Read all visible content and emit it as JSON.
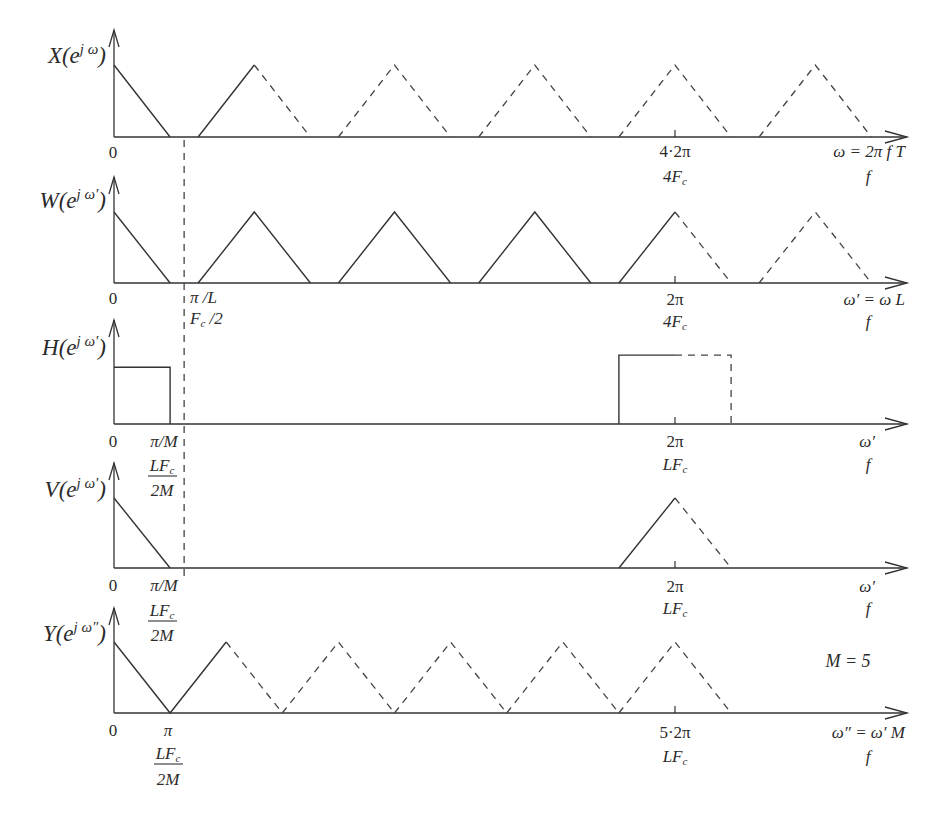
{
  "figure": {
    "note": "M = 5",
    "reference_line": {
      "panel": "w",
      "position_pi": 0.25,
      "meaning": "π/L",
      "style": "dashed"
    },
    "panels": {
      "x": {
        "ylabel": {
          "base": "X(e",
          "sup": "j ω",
          "close": ")"
        },
        "origin": "0",
        "tick": {
          "position_pi": 8,
          "line1": "4·2π",
          "line2_main": "4F",
          "line2_sub": "c"
        },
        "axis_label": {
          "line1": "ω = 2π f T",
          "line2": "f"
        },
        "components": [
          {
            "style": "solid",
            "points": [
              [
                0,
                1
              ],
              [
                0.8,
                0
              ]
            ]
          },
          {
            "style": "solid",
            "points": [
              [
                1.2,
                0
              ],
              [
                2,
                1
              ]
            ]
          },
          {
            "style": "dashed",
            "points": [
              [
                2,
                1
              ],
              [
                2.8,
                0
              ]
            ]
          },
          {
            "style": "dashed",
            "points": [
              [
                3.2,
                0
              ],
              [
                4,
                1
              ],
              [
                4.8,
                0
              ]
            ]
          },
          {
            "style": "dashed",
            "points": [
              [
                5.2,
                0
              ],
              [
                6,
                1
              ],
              [
                6.8,
                0
              ]
            ]
          },
          {
            "style": "dashed",
            "points": [
              [
                7.2,
                0
              ],
              [
                8,
                1
              ],
              [
                8.8,
                0
              ]
            ]
          },
          {
            "style": "dashed",
            "points": [
              [
                9.2,
                0
              ],
              [
                10,
                1
              ],
              [
                10.8,
                0
              ]
            ]
          }
        ]
      },
      "w": {
        "ylabel": {
          "base": "W(e",
          "sup": "j ω′",
          "close": ")"
        },
        "origin": "0",
        "cutoff": {
          "line1": "π /L",
          "line2_main": "F",
          "line2_sub": "c",
          "line2_rest": " /2"
        },
        "tick": {
          "position_pi": 2,
          "line1": "2π",
          "line2_main": "4F",
          "line2_sub": "c"
        },
        "axis_label": {
          "line1": "ω′ = ω  L",
          "line2": "f"
        },
        "components": [
          {
            "style": "solid",
            "points": [
              [
                0,
                1
              ],
              [
                0.2,
                0
              ]
            ]
          },
          {
            "style": "solid",
            "points": [
              [
                0.3,
                0
              ],
              [
                0.5,
                1
              ],
              [
                0.7,
                0
              ]
            ]
          },
          {
            "style": "solid",
            "points": [
              [
                0.8,
                0
              ],
              [
                1,
                1
              ],
              [
                1.2,
                0
              ]
            ]
          },
          {
            "style": "solid",
            "points": [
              [
                1.3,
                0
              ],
              [
                1.5,
                1
              ],
              [
                1.7,
                0
              ]
            ]
          },
          {
            "style": "solid",
            "points": [
              [
                1.8,
                0
              ],
              [
                2,
                1
              ]
            ]
          },
          {
            "style": "dashed",
            "points": [
              [
                2,
                1
              ],
              [
                2.2,
                0
              ]
            ]
          },
          {
            "style": "dashed",
            "points": [
              [
                2.3,
                0
              ],
              [
                2.5,
                1
              ],
              [
                2.7,
                0
              ]
            ]
          }
        ]
      },
      "h": {
        "ylabel": {
          "base": "H(e",
          "sup": "j ω′",
          "close": ")"
        },
        "origin": "0",
        "cutoff": {
          "line1": "π/M",
          "num_main": "LF",
          "num_sub": "c",
          "den": "2M"
        },
        "tick": {
          "position_pi": 2,
          "line1": "2π",
          "line2_main": "LF",
          "line2_sub": "c"
        },
        "axis_label": {
          "line1": "ω′",
          "line2": "f"
        },
        "components": [
          {
            "style": "solid",
            "points": [
              [
                0,
                0.8
              ],
              [
                0.2,
                0.8
              ],
              [
                0.2,
                0
              ]
            ]
          },
          {
            "style": "solid",
            "points": [
              [
                1.8,
                0
              ],
              [
                1.8,
                0.97
              ],
              [
                2,
                0.97
              ]
            ]
          },
          {
            "style": "dashed",
            "points": [
              [
                2,
                0.97
              ],
              [
                2.2,
                0.97
              ],
              [
                2.2,
                0
              ]
            ]
          }
        ]
      },
      "v": {
        "ylabel": {
          "base": "V(e",
          "sup": "j ω′",
          "close": ")"
        },
        "origin": "0",
        "cutoff": {
          "line1": "π/M",
          "num_main": "LF",
          "num_sub": "c",
          "den": "2M"
        },
        "tick": {
          "position_pi": 2,
          "line1": "2π",
          "line2_main": "LF",
          "line2_sub": "c"
        },
        "axis_label": {
          "line1": "ω′",
          "line2": "f"
        },
        "components": [
          {
            "style": "solid",
            "points": [
              [
                0,
                1
              ],
              [
                0.2,
                0
              ]
            ]
          },
          {
            "style": "solid",
            "points": [
              [
                1.8,
                0
              ],
              [
                2,
                1
              ]
            ]
          },
          {
            "style": "dashed",
            "points": [
              [
                2,
                1
              ],
              [
                2.2,
                0
              ]
            ]
          }
        ]
      },
      "y": {
        "ylabel": {
          "base": "Y(e",
          "sup": "j ω″",
          "close": ")"
        },
        "origin": "0",
        "cutoff": {
          "line1": "π",
          "num_main": "LF",
          "num_sub": "c",
          "den": "2M"
        },
        "tick": {
          "position_pi": 10,
          "line1": "5·2π",
          "line2_main": "LF",
          "line2_sub": "c"
        },
        "axis_label": {
          "line1": "ω″ = ω′ M",
          "line2": "f"
        },
        "components": [
          {
            "style": "solid",
            "points": [
              [
                0,
                1
              ],
              [
                1,
                0
              ],
              [
                2,
                1
              ]
            ]
          },
          {
            "style": "dashed",
            "points": [
              [
                2,
                1
              ],
              [
                3,
                0
              ]
            ]
          },
          {
            "style": "dashed",
            "points": [
              [
                3,
                0
              ],
              [
                4,
                1
              ],
              [
                5,
                0
              ]
            ]
          },
          {
            "style": "dashed",
            "points": [
              [
                5,
                0
              ],
              [
                6,
                1
              ],
              [
                7,
                0
              ]
            ]
          },
          {
            "style": "dashed",
            "points": [
              [
                7,
                0
              ],
              [
                8,
                1
              ],
              [
                9,
                0
              ]
            ]
          },
          {
            "style": "dashed",
            "points": [
              [
                9,
                0
              ],
              [
                10,
                1
              ],
              [
                11,
                0
              ]
            ]
          }
        ]
      }
    }
  }
}
